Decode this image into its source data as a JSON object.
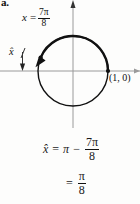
{
  "part_label": "a.",
  "figure": {
    "name": "unit-circle-diagram",
    "angle_label": {
      "variable": "x",
      "equals": "=",
      "numerator": "7π",
      "denominator": "8"
    },
    "reference_angle_label": "x̂",
    "point_label": "(1, 0)",
    "axes": {
      "x_axis": "horizontal-axis",
      "y_axis": "vertical-axis"
    },
    "circle": {
      "center_x": 73,
      "center_y": 71,
      "radius": 35,
      "terminal_angle_degrees": 157.5,
      "terminal_point_label": "terminal-point",
      "initial_point_label": "initial-point"
    },
    "colors": {
      "ink": "#111111",
      "axis": "#8a8a8a",
      "background": "#fdfdfc"
    }
  },
  "derivation": {
    "line1": {
      "lhs": "x̂",
      "equals": "=",
      "term1": "π",
      "operator": "−",
      "numerator": "7π",
      "denominator": "8"
    },
    "line2": {
      "equals": "=",
      "numerator": "π",
      "denominator": "8"
    }
  }
}
